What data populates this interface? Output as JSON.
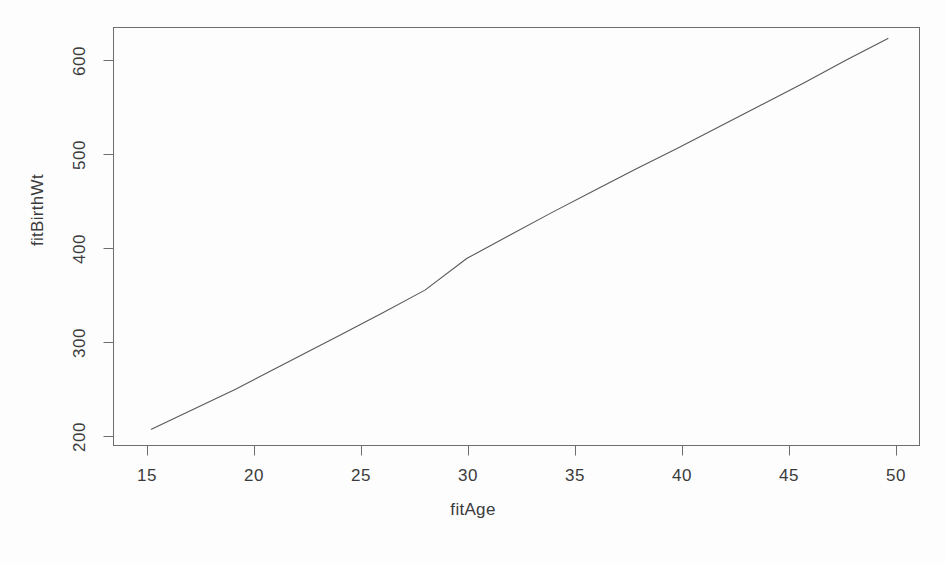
{
  "chart_data": {
    "type": "line",
    "title": "",
    "subtitle": "",
    "xlabel": "fitAge",
    "ylabel": "fitBirthWt",
    "xlim": [
      13.2,
      51.5
    ],
    "ylim": [
      172,
      632
    ],
    "grid": false,
    "legend": null,
    "legend_position": "none",
    "x_ticks": [
      15,
      20,
      25,
      30,
      35,
      40,
      45,
      50
    ],
    "x_tick_labels": [
      "15",
      "20",
      "25",
      "30",
      "35",
      "40",
      "45",
      "50"
    ],
    "y_ticks": [
      200,
      300,
      400,
      500,
      600
    ],
    "y_tick_labels": [
      "200",
      "300",
      "400",
      "500",
      "600"
    ],
    "series": [
      {
        "name": "fitBirthWt",
        "color": "#595959",
        "line_width": 1,
        "x": [
          15,
          16,
          17,
          18,
          19,
          20,
          22,
          24,
          26,
          28,
          30,
          32,
          34,
          36,
          38,
          40,
          42,
          44,
          46,
          48,
          50
        ],
        "values": [
          190,
          201,
          212,
          223,
          234,
          246,
          270,
          294,
          318,
          343,
          378,
          403,
          428,
          452,
          476,
          499,
          523,
          547,
          571,
          596,
          620
        ]
      }
    ],
    "annotations": []
  },
  "axes": {
    "x_axis_name": "fitAge",
    "y_axis_name": "fitBirthWt"
  }
}
